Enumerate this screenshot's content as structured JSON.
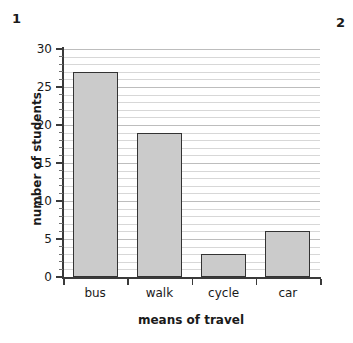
{
  "annotations": {
    "question_number_left": "1",
    "question_number_right": "2"
  },
  "chart_data": {
    "type": "bar",
    "title": "",
    "xlabel": "means of travel",
    "ylabel": "number of students",
    "categories": [
      "bus",
      "walk",
      "cycle",
      "car"
    ],
    "values": [
      27,
      19,
      3,
      6
    ],
    "ylim": [
      0,
      30
    ],
    "ytick_labels": [
      "0",
      "5",
      "10",
      "15",
      "20",
      "25",
      "30"
    ],
    "ytick_values": [
      0,
      5,
      10,
      15,
      20,
      25,
      30
    ],
    "y_major_step": 5,
    "y_minor_step": 1,
    "grid": "horizontal",
    "legend": "none",
    "bar_fill_color": "#cbcbcb",
    "bar_edge_color": "#333333",
    "axis_color": "#3a3a3a",
    "gridline_color": "#d7d7d7",
    "background_color": "#ffffff"
  }
}
